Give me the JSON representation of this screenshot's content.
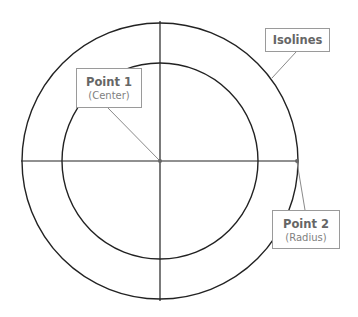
{
  "diagram": {
    "center": {
      "x": 160,
      "y": 161
    },
    "outer_radius": 138,
    "inner_radius": 98,
    "colors": {
      "stroke": "#222222",
      "leader": "#8a8a8a",
      "box_border": "#9a9a9a",
      "text": "#666666"
    },
    "labels": {
      "point1": {
        "title": "Point 1",
        "subtitle": "(Center)"
      },
      "point2": {
        "title": "Point 2",
        "subtitle": "(Radius)"
      },
      "isolines": {
        "title": "Isolines"
      }
    }
  }
}
